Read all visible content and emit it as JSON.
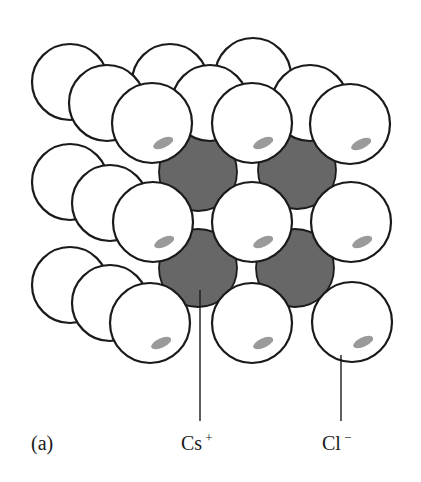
{
  "figure": {
    "panel_label": "(a)",
    "labels": {
      "cation": {
        "text": "Cs",
        "charge": "+"
      },
      "anion": {
        "text": "Cl",
        "charge": "−"
      }
    },
    "colors": {
      "anion_fill": "#ffffff",
      "cation_fill": "#676767",
      "outline": "#1a1a1a",
      "highlight": "#9a9a9a"
    }
  },
  "spheres": {
    "back_cl": [
      {
        "cx": 70,
        "cy": 82,
        "r": 38
      },
      {
        "cx": 170,
        "cy": 82,
        "r": 38
      },
      {
        "cx": 253,
        "cy": 76,
        "r": 38
      },
      {
        "cx": 70,
        "cy": 182,
        "r": 38
      },
      {
        "cx": 70,
        "cy": 285,
        "r": 38
      }
    ],
    "cs": [
      {
        "cx": 198,
        "cy": 172,
        "r": 39
      },
      {
        "cx": 297,
        "cy": 170,
        "r": 39
      },
      {
        "cx": 198,
        "cy": 268,
        "r": 39
      },
      {
        "cx": 295,
        "cy": 268,
        "r": 39
      }
    ],
    "mid_cl": [
      {
        "cx": 107,
        "cy": 103,
        "r": 38
      },
      {
        "cx": 210,
        "cy": 103,
        "r": 38
      },
      {
        "cx": 310,
        "cy": 103,
        "r": 38
      },
      {
        "cx": 110,
        "cy": 203,
        "r": 38
      },
      {
        "cx": 110,
        "cy": 303,
        "r": 38
      }
    ],
    "front_cl": [
      {
        "cx": 152,
        "cy": 123,
        "r": 40
      },
      {
        "cx": 252,
        "cy": 123,
        "r": 40
      },
      {
        "cx": 350,
        "cy": 124,
        "r": 40
      },
      {
        "cx": 153,
        "cy": 222,
        "r": 40
      },
      {
        "cx": 252,
        "cy": 222,
        "r": 40
      },
      {
        "cx": 351,
        "cy": 222,
        "r": 40
      },
      {
        "cx": 150,
        "cy": 323,
        "r": 40
      },
      {
        "cx": 252,
        "cy": 323,
        "r": 40
      },
      {
        "cx": 352,
        "cy": 322,
        "r": 40
      }
    ]
  },
  "leaders": {
    "cation": {
      "x": 200,
      "y1": 290,
      "y2": 421
    },
    "anion": {
      "x": 341,
      "y1": 355,
      "y2": 421
    }
  }
}
